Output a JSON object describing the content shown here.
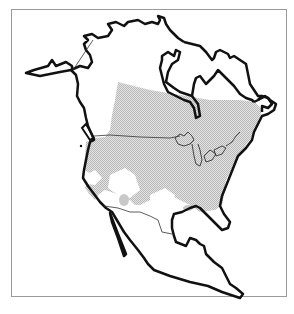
{
  "map": {
    "region": "North America",
    "type": "species range map",
    "colors": {
      "background": "#ffffff",
      "frame": "#9a9a9a",
      "coastline": "#111111",
      "borders": "#333333",
      "range_fill": "#c8c8c8"
    },
    "features": [
      "coastline",
      "alaska-canada-border",
      "us-canada-border",
      "us-mexico-border",
      "great-lakes",
      "range-shading"
    ]
  }
}
